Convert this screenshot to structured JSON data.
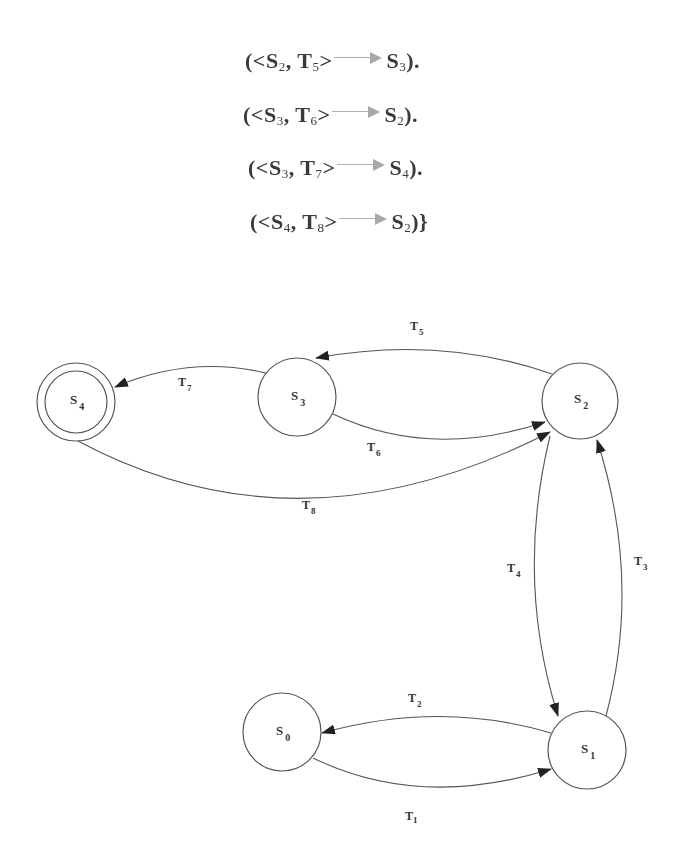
{
  "formulas": [
    {
      "open": "(<",
      "state": "S",
      "state_sub": "2",
      "sep": ", ",
      "trans": "T",
      "trans_sub": "5",
      "close_angle": ">",
      "target": "S",
      "target_sub": "3",
      "tail": ")."
    },
    {
      "open": "(<",
      "state": "S",
      "state_sub": "3",
      "sep": ", ",
      "trans": "T",
      "trans_sub": "6",
      "close_angle": ">",
      "target": "S",
      "target_sub": "2",
      "tail": ")."
    },
    {
      "open": "(<",
      "state": "S",
      "state_sub": "3",
      "sep": ", ",
      "trans": "T",
      "trans_sub": "7",
      "close_angle": ">",
      "target": "S",
      "target_sub": "4",
      "tail": ")."
    },
    {
      "open": "(<",
      "state": "S",
      "state_sub": "4",
      "sep": ", ",
      "trans": "T",
      "trans_sub": "8",
      "close_angle": ">",
      "target": "S",
      "target_sub": "2",
      "tail": ")}"
    }
  ],
  "diagram": {
    "nodes": [
      {
        "id": "S0",
        "label": "S",
        "sub": "0",
        "accepting": false
      },
      {
        "id": "S1",
        "label": "S",
        "sub": "1",
        "accepting": false
      },
      {
        "id": "S2",
        "label": "S",
        "sub": "2",
        "accepting": false
      },
      {
        "id": "S3",
        "label": "S",
        "sub": "3",
        "accepting": false
      },
      {
        "id": "S4",
        "label": "S",
        "sub": "4",
        "accepting": true
      }
    ],
    "edges": [
      {
        "id": "T1",
        "label": "T",
        "sub": "1",
        "from": "S0",
        "to": "S1"
      },
      {
        "id": "T2",
        "label": "T",
        "sub": "2",
        "from": "S1",
        "to": "S0"
      },
      {
        "id": "T3",
        "label": "T",
        "sub": "3",
        "from": "S1",
        "to": "S2"
      },
      {
        "id": "T4",
        "label": "T",
        "sub": "4",
        "from": "S2",
        "to": "S1"
      },
      {
        "id": "T5",
        "label": "T",
        "sub": "5",
        "from": "S2",
        "to": "S3"
      },
      {
        "id": "T6",
        "label": "T",
        "sub": "6",
        "from": "S3",
        "to": "S2"
      },
      {
        "id": "T7",
        "label": "T",
        "sub": "7",
        "from": "S3",
        "to": "S4"
      },
      {
        "id": "T8",
        "label": "T",
        "sub": "8",
        "from": "S4",
        "to": "S2"
      }
    ]
  },
  "colors": {
    "stroke": "#444444",
    "arrowhead": "#222222",
    "formula_arrow": "#a8a8a8",
    "background": "#ffffff"
  }
}
